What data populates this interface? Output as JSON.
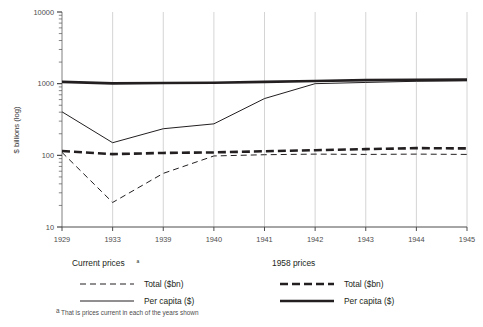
{
  "chart_data": {
    "type": "line",
    "title": "",
    "subtitle": "",
    "xlabel": "",
    "ylabel": "$ billions (log)",
    "yscale": "log",
    "ylim": [
      10,
      10000
    ],
    "ytick_labels": [
      "10000",
      "1000",
      "100",
      "10"
    ],
    "ytick_values": [
      10000,
      1000,
      100,
      10
    ],
    "grid": "vertical only, light grey at each category",
    "legend_position": "below plot, two groups side by side",
    "categories": [
      "1929",
      "1933",
      "1939",
      "1940",
      "1941",
      "1942",
      "1943",
      "1944",
      "1945"
    ],
    "x": [
      1929,
      1933,
      1939,
      1940,
      1941,
      1942,
      1943,
      1944,
      1945
    ],
    "series": [
      {
        "name": "1958 prices — Per capita ($)",
        "group": "1958 prices",
        "label": "Per capita ($)",
        "style": "thick-solid",
        "color": "#231f20",
        "width": 2.6,
        "values": [
          1060,
          1010,
          1020,
          1030,
          1060,
          1090,
          1120,
          1130,
          1140
        ]
      },
      {
        "name": "1958 prices — Total ($bn)",
        "group": "1958 prices",
        "label": "Total ($bn)",
        "style": "thick-dashed",
        "color": "#231f20",
        "width": 2.6,
        "values": [
          115,
          104,
          108,
          110,
          114,
          118,
          122,
          126,
          125
        ]
      },
      {
        "name": "Current prices — Per capita ($)",
        "group": "Current prices",
        "label": "Per capita ($)",
        "style": "thin-solid",
        "color": "#231f20",
        "width": 1.0,
        "values": [
          405,
          150,
          235,
          275,
          620,
          1000,
          1040,
          1080,
          1095
        ]
      },
      {
        "name": "Current prices — Total ($bn)",
        "group": "Current prices",
        "label": "Total ($bn)",
        "style": "thin-dashed",
        "color": "#231f20",
        "width": 1.0,
        "values": [
          110,
          22,
          56,
          98,
          102,
          104,
          103,
          104,
          103
        ]
      }
    ]
  },
  "axis": {
    "y_title": "$ billions (log)",
    "y_ticks": [
      "10000",
      "1000",
      "100",
      "10"
    ],
    "x_ticks": [
      "1929",
      "1933",
      "1939",
      "1940",
      "1941",
      "1942",
      "1943",
      "1944",
      "1945"
    ]
  },
  "legend": {
    "left": {
      "title": "Current prices",
      "title_superscript": "a",
      "items": [
        {
          "label": "Total ($bn)",
          "swatch": "thin-dashed"
        },
        {
          "label": "Per capita ($)",
          "swatch": "thin-solid"
        }
      ]
    },
    "right": {
      "title": "1958 prices",
      "title_superscript": "",
      "items": [
        {
          "label": "Total ($bn)",
          "swatch": "thick-dashed"
        },
        {
          "label": "Per capita ($)",
          "swatch": "thick-solid"
        }
      ]
    }
  },
  "footnote": {
    "marker": "a",
    "text": "That is prices current in each of the years shown"
  },
  "colors": {
    "ink": "#231f20",
    "grid": "#c9c9c9",
    "axis": "#8c8c8c",
    "text": "#4d4d4d",
    "background": "#ffffff"
  }
}
